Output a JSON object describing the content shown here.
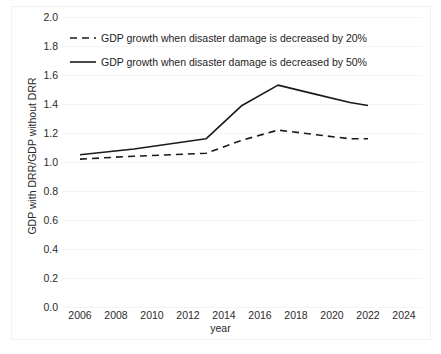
{
  "chart_data": {
    "type": "line",
    "title": "",
    "xlabel": "year",
    "ylabel": "GDP with DRR/GDP without DRR",
    "xlim": [
      2005,
      2025
    ],
    "ylim": [
      0.0,
      2.0
    ],
    "grid": true,
    "legend_position": "top-left-inside",
    "xticks": [
      "2006",
      "2008",
      "2010",
      "2012",
      "2014",
      "2016",
      "2018",
      "2020",
      "2022",
      "2024"
    ],
    "yticks": [
      "0.0",
      "0.2",
      "0.4",
      "0.6",
      "0.8",
      "1.0",
      "1.2",
      "1.4",
      "1.6",
      "1.8",
      "2.0"
    ],
    "x": [
      2006,
      2009,
      2013,
      2015,
      2017,
      2019,
      2021,
      2022
    ],
    "series": [
      {
        "name": "GDP growth when disaster damage is decreased by 20%",
        "style": "dashed",
        "color": "#1a1a1a",
        "values": [
          1.02,
          1.04,
          1.06,
          1.15,
          1.22,
          1.19,
          1.16,
          1.16
        ]
      },
      {
        "name": "GDP growth when disaster damage is decreased by 50%",
        "style": "solid",
        "color": "#1a1a1a",
        "values": [
          1.05,
          1.09,
          1.16,
          1.39,
          1.53,
          1.47,
          1.41,
          1.39
        ]
      }
    ]
  },
  "legend": {
    "items": [
      {
        "label": "GDP growth when disaster damage is decreased by 20%",
        "style": "dashed"
      },
      {
        "label": "GDP growth when disaster damage is decreased by 50%",
        "style": "solid"
      }
    ]
  },
  "axes": {
    "x_title": "year",
    "y_title": "GDP with DRR/GDP without DRR"
  }
}
